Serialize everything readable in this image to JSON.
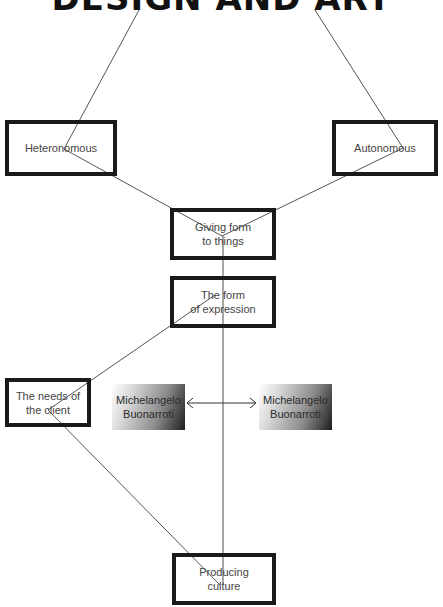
{
  "diagram": {
    "title": "DESIGN AND ART",
    "nodes": {
      "heteronomous": "Heteronomous",
      "autonomous": "Autonomous",
      "giving_form": "Giving form\nto things",
      "form_of_expression": "The form\nof expression",
      "needs_of_client": "The needs of\nthe client",
      "producing_culture": "Producing\nculture",
      "michelangelo_left": "Michelangelo\nBuonarroti",
      "michelangelo_right": "Michelangelo\nBuonarroti"
    },
    "edges": [
      {
        "from": "title",
        "to": "heteronomous"
      },
      {
        "from": "title",
        "to": "autonomous"
      },
      {
        "from": "heteronomous",
        "to": "giving_form"
      },
      {
        "from": "autonomous",
        "to": "giving_form"
      },
      {
        "from": "giving_form",
        "to": "producing_culture"
      },
      {
        "from": "form_of_expression",
        "to": "needs_of_client"
      },
      {
        "from": "needs_of_client",
        "to": "producing_culture"
      },
      {
        "from": "michelangelo_left",
        "to": "michelangelo_right",
        "type": "double-arrow"
      }
    ],
    "colors": {
      "box_border": "#1a1a1a",
      "line": "#555555",
      "shade_dark": "#1e1e1e"
    }
  }
}
